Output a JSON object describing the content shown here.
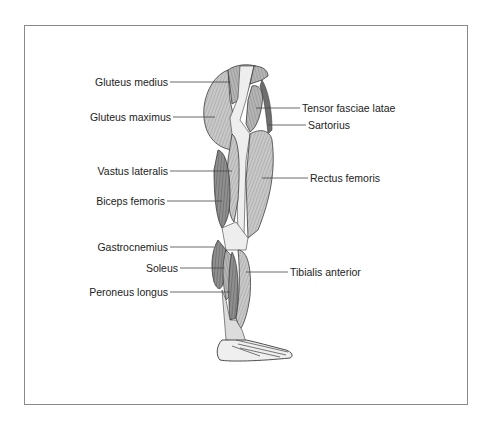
{
  "figure": {
    "labels_left": [
      {
        "id": "gluteus-medius",
        "text": "Gluteus medius"
      },
      {
        "id": "gluteus-maximus",
        "text": "Gluteus maximus"
      },
      {
        "id": "vastus-lateralis",
        "text": "Vastus lateralis"
      },
      {
        "id": "biceps-femoris",
        "text": "Biceps femoris"
      },
      {
        "id": "gastrocnemius",
        "text": "Gastrocnemius"
      },
      {
        "id": "soleus",
        "text": "Soleus"
      },
      {
        "id": "peroneus-longus",
        "text": "Peroneus longus"
      }
    ],
    "labels_right": [
      {
        "id": "tensor-fasciae-latae",
        "text": "Tensor fasciae latae"
      },
      {
        "id": "sartorius",
        "text": "Sartorius"
      },
      {
        "id": "rectus-femoris",
        "text": "Rectus femoris"
      },
      {
        "id": "tibialis-anterior",
        "text": "Tibialis anterior"
      }
    ],
    "colors": {
      "muscle_light": "#c9c9c9",
      "muscle_mid": "#a8a8a8",
      "muscle_dark": "#7d7d7d",
      "tendon": "#eeeeee",
      "outline": "#3a3a3a",
      "leader": "#444444",
      "frame": "#8a8a8a"
    }
  }
}
